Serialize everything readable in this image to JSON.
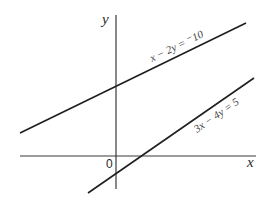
{
  "diagram": {
    "type": "coordinate-plane-linear-equations",
    "axes": {
      "x_label": "x",
      "y_label": "y",
      "origin_label": "0"
    },
    "lines": [
      {
        "id": "line-1",
        "equation": "x − 2y = ⁻10",
        "slope": 0.5,
        "y_intercept": 5,
        "color": "#1e1e1e"
      },
      {
        "id": "line-2",
        "equation": "3x − 4y = 5",
        "slope": 0.75,
        "y_intercept": -1.25,
        "color": "#1e1e1e"
      }
    ]
  }
}
